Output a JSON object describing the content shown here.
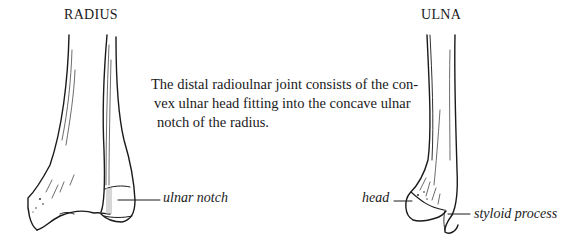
{
  "figure": {
    "bones": [
      {
        "title": "RADIUS",
        "labels": [
          "ulnar notch"
        ]
      },
      {
        "title": "ULNA",
        "labels": [
          "head",
          "styloid process"
        ]
      }
    ],
    "caption_lines": [
      "The distal radioulnar joint consists of the con-",
      "vex ulnar head fitting into the concave ulnar",
      "notch of the radius."
    ],
    "colors": {
      "line": "#1a1a1a",
      "background": "#ffffff"
    }
  }
}
